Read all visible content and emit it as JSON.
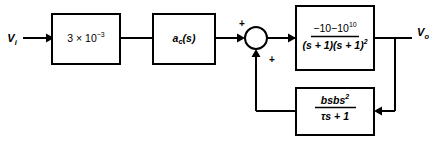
{
  "diagram": {
    "type": "control-system-block-diagram",
    "canvas": {
      "width": 440,
      "height": 141,
      "background": "#ffffff",
      "line_color": "#000000"
    },
    "input": {
      "label_base": "V",
      "label_sub": "i",
      "full": "Vi"
    },
    "output": {
      "label_base": "V",
      "label_sub": "o",
      "full": "Vo"
    },
    "blocks": [
      {
        "id": "gain-block",
        "name": "input-gain-block",
        "text": "3 × 10⁻³",
        "mantissa": "3 × 10",
        "exponent": "−3",
        "x": 52,
        "y": 14,
        "width": 68,
        "height": 50
      },
      {
        "id": "compensator-block",
        "name": "compensator-block",
        "text": "a",
        "subscript": "c",
        "argument": "(s)",
        "x": 153,
        "y": 14,
        "width": 62,
        "height": 50
      },
      {
        "id": "plant-block",
        "name": "plant-transfer-function-block",
        "numerator": "−10",
        "numerator_exponent": "10",
        "denominator": "(s + 1)",
        "denominator_exponent": "2",
        "text": "−10¹⁰ / (s + 1)²",
        "x": 296,
        "y": 6,
        "width": 78,
        "height": 64
      },
      {
        "id": "feedback-block",
        "name": "feedback-transfer-function-block",
        "numerator": "bs",
        "numerator_exponent": "2",
        "denominator": "τs + 1",
        "text": "bs² / (τs + 1)",
        "x": 296,
        "y": 88,
        "width": 78,
        "height": 47
      }
    ],
    "summing_junction": {
      "name": "summing-junction",
      "cx": 256,
      "cy": 38,
      "r": 11,
      "signs": [
        {
          "label": "+",
          "position": "top-left",
          "x": 241,
          "y": 24
        },
        {
          "label": "+",
          "position": "bottom-right",
          "x": 272,
          "y": 61
        }
      ]
    }
  }
}
